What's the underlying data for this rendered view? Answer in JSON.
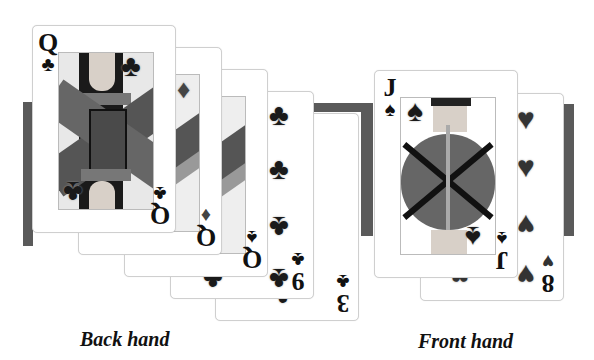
{
  "layout": {
    "band_color": "#5a5a5a",
    "card_border": "#cfcfcf"
  },
  "back_hand": {
    "label": "Back hand",
    "cards": [
      {
        "rank": "Q",
        "suit": "♣",
        "suit_name": "clubs",
        "type": "face"
      },
      {
        "rank": "Q",
        "suit": "♦",
        "suit_name": "diamonds",
        "type": "face"
      },
      {
        "rank": "Q",
        "suit": "♠",
        "suit_name": "spades",
        "type": "face"
      },
      {
        "rank": "9",
        "suit": "♣",
        "suit_name": "clubs",
        "type": "pip"
      },
      {
        "rank": "3",
        "suit": "♣",
        "suit_name": "clubs",
        "type": "pip"
      }
    ]
  },
  "front_hand": {
    "label": "Front hand",
    "cards": [
      {
        "rank": "J",
        "suit": "♠",
        "suit_name": "spades",
        "type": "face"
      },
      {
        "rank": "8",
        "suit": "♥",
        "suit_name": "hearts",
        "type": "pip"
      }
    ]
  }
}
